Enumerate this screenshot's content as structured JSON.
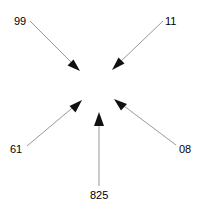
{
  "diagram": {
    "type": "converging-arrow-diagram",
    "width": 202,
    "height": 212,
    "background_color": "#ffffff",
    "line_color": "#999999",
    "arrowhead_color": "#000000",
    "label_color": "#000000",
    "nodes": [
      {
        "id": "node-99",
        "label": "99",
        "label_x": 14,
        "label_y": 16,
        "line_x1": 30,
        "line_y1": 21,
        "line_x2": 75,
        "line_y2": 66,
        "arrow_direction": "down-right"
      },
      {
        "id": "node-11",
        "label": "11",
        "label_x": 165,
        "label_y": 16,
        "line_x1": 163,
        "line_y1": 21,
        "line_x2": 117,
        "line_y2": 65,
        "arrow_direction": "down-left"
      },
      {
        "id": "node-61",
        "label": "61",
        "label_x": 10,
        "label_y": 144,
        "line_x1": 27,
        "line_y1": 146,
        "line_x2": 78,
        "line_y2": 103,
        "arrow_direction": "up-right"
      },
      {
        "id": "node-08",
        "label": "08",
        "label_x": 179,
        "label_y": 144,
        "line_x1": 176,
        "line_y1": 145,
        "line_x2": 117,
        "line_y2": 100,
        "arrow_direction": "up-left"
      },
      {
        "id": "node-825",
        "label": "825",
        "label_x": 90,
        "label_y": 190,
        "line_x1": 99,
        "line_y1": 186,
        "line_x2": 99,
        "line_y2": 114,
        "arrow_direction": "up"
      }
    ]
  }
}
